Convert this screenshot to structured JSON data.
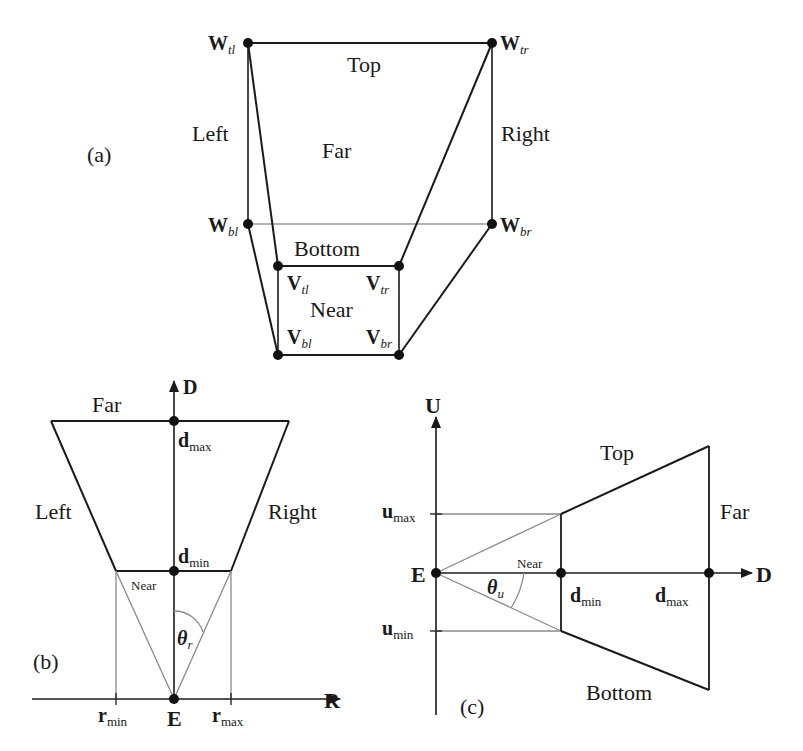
{
  "figure": {
    "panel_a": {
      "tag": "(a)",
      "regions": {
        "top": "Top",
        "left": "Left",
        "right": "Right",
        "far": "Far",
        "bottom": "Bottom",
        "near": "Near"
      },
      "vertices": {
        "w_tl": {
          "base": "W",
          "sub": "tl"
        },
        "w_tr": {
          "base": "W",
          "sub": "tr"
        },
        "w_bl": {
          "base": "W",
          "sub": "bl"
        },
        "w_br": {
          "base": "W",
          "sub": "br"
        },
        "v_tl": {
          "base": "V",
          "sub": "tl"
        },
        "v_tr": {
          "base": "V",
          "sub": "tr"
        },
        "v_bl": {
          "base": "V",
          "sub": "bl"
        },
        "v_br": {
          "base": "V",
          "sub": "br"
        }
      }
    },
    "panel_b": {
      "tag": "(b)",
      "axes": {
        "vertical": "D",
        "horizontal": "R"
      },
      "regions": {
        "far": "Far",
        "left": "Left",
        "right": "Right",
        "near": "Near"
      },
      "points": {
        "d_max": {
          "base": "d",
          "sub": "max"
        },
        "d_min": {
          "base": "d",
          "sub": "min"
        },
        "r_min": {
          "base": "r",
          "sub": "min"
        },
        "r_max": {
          "base": "r",
          "sub": "max"
        },
        "eye": "E"
      },
      "angle": {
        "base": "θ",
        "sub": "r"
      }
    },
    "panel_c": {
      "tag": "(c)",
      "axes": {
        "vertical": "U",
        "horizontal": "D"
      },
      "regions": {
        "top": "Top",
        "far": "Far",
        "bottom": "Bottom",
        "near": "Near"
      },
      "points": {
        "u_max": {
          "base": "u",
          "sub": "max"
        },
        "u_min": {
          "base": "u",
          "sub": "min"
        },
        "d_min": {
          "base": "d",
          "sub": "min"
        },
        "d_max": {
          "base": "d",
          "sub": "max"
        },
        "eye": "E"
      },
      "angle": {
        "base": "θ",
        "sub": "u"
      }
    }
  }
}
